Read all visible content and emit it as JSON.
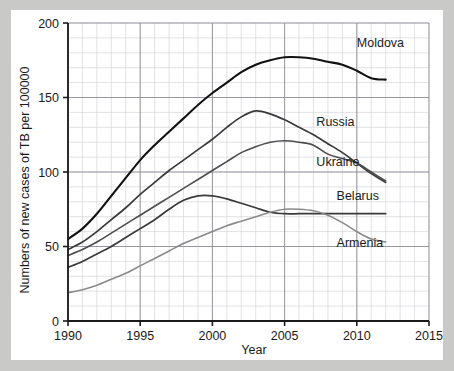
{
  "figure": {
    "background_color": "#c9c9c7",
    "card_color": "#ffffff"
  },
  "chart_data": {
    "type": "line",
    "title": "",
    "xlabel": "Year",
    "ylabel": "Numbers of new cases of TB per 100000",
    "xlim": [
      1990,
      2015
    ],
    "ylim": [
      0,
      200
    ],
    "xticks": [
      1990,
      1995,
      2000,
      2005,
      2010,
      2015
    ],
    "xtick_labels": [
      "1990",
      "1995",
      "2000",
      "2005",
      "2010",
      "2015"
    ],
    "yticks": [
      0,
      50,
      100,
      150,
      200
    ],
    "ytick_labels": [
      "0",
      "50",
      "100",
      "150",
      "200"
    ],
    "grid": true,
    "grid_minor_x_step": 1,
    "grid_minor_y_step": 10,
    "grid_major_x_step": 5,
    "grid_major_y_step": 50,
    "legend_position": "inline-right-of-line-ends",
    "series": [
      {
        "name": "Moldova",
        "color": "#111111",
        "width": 2.1,
        "label_x": 2010.0,
        "label_y": 184,
        "x": [
          1990,
          1991,
          1992,
          1993,
          1994,
          1995,
          1996,
          1997,
          1998,
          1999,
          2000,
          2001,
          2002,
          2003,
          2004,
          2005,
          2006,
          2007,
          2008,
          2009,
          2010,
          2011,
          2012
        ],
        "y": [
          55,
          62,
          72,
          84,
          96,
          108,
          118,
          127,
          136,
          145,
          153,
          160,
          167,
          172,
          175,
          177,
          177,
          176,
          174,
          172,
          168,
          163,
          162
        ]
      },
      {
        "name": "Russia",
        "color": "#3a3a3a",
        "width": 1.7,
        "label_x": 2007.2,
        "label_y": 131,
        "x": [
          1990,
          1991,
          1992,
          1993,
          1994,
          1995,
          1996,
          1997,
          1998,
          1999,
          2000,
          2001,
          2002,
          2003,
          2004,
          2005,
          2006,
          2007,
          2008,
          2009,
          2010,
          2011,
          2012
        ],
        "y": [
          48,
          53,
          60,
          68,
          76,
          85,
          93,
          101,
          108,
          115,
          122,
          130,
          137,
          141,
          139,
          135,
          130,
          125,
          119,
          113,
          106,
          99,
          93
        ]
      },
      {
        "name": "Ukraine",
        "color": "#4d4d4d",
        "width": 1.6,
        "label_x": 2007.2,
        "label_y": 104,
        "x": [
          1990,
          1991,
          1992,
          1993,
          1994,
          1995,
          1996,
          1997,
          1998,
          1999,
          2000,
          2001,
          2002,
          2003,
          2004,
          2005,
          2006,
          2007,
          2008,
          2009,
          2010,
          2011,
          2012
        ],
        "y": [
          44,
          48,
          53,
          59,
          65,
          71,
          77,
          83,
          89,
          95,
          101,
          107,
          113,
          117,
          120,
          121,
          120,
          118,
          112,
          109,
          106,
          100,
          94
        ]
      },
      {
        "name": "Belarus",
        "color": "#3a3a3a",
        "width": 1.7,
        "label_x": 2008.6,
        "label_y": 81,
        "x": [
          1990,
          1991,
          1992,
          1993,
          1994,
          1995,
          1996,
          1997,
          1998,
          1999,
          2000,
          2001,
          2002,
          2003,
          2004,
          2005,
          2006,
          2007,
          2008,
          2009,
          2010,
          2011,
          2012
        ],
        "y": [
          36,
          40,
          45,
          50,
          56,
          62,
          68,
          75,
          81,
          84,
          84,
          82,
          79,
          76,
          73,
          72,
          72,
          72,
          72,
          72,
          72,
          72,
          72
        ]
      },
      {
        "name": "Armenia",
        "color": "#8a8a8a",
        "width": 1.6,
        "label_x": 2008.6,
        "label_y": 50,
        "x": [
          1990,
          1991,
          1992,
          1993,
          1994,
          1995,
          1996,
          1997,
          1998,
          1999,
          2000,
          2001,
          2002,
          2003,
          2004,
          2005,
          2006,
          2007,
          2008,
          2009,
          2010,
          2011,
          2012
        ],
        "y": [
          19,
          21,
          24,
          28,
          32,
          37,
          42,
          47,
          52,
          56,
          60,
          64,
          67,
          70,
          73,
          75,
          75,
          74,
          71,
          66,
          60,
          55,
          53
        ]
      }
    ]
  }
}
